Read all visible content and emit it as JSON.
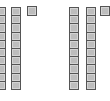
{
  "diagram": {
    "type": "base-ten-blocks",
    "groups": [
      {
        "label": "group-1",
        "tens_rods": 2,
        "units": 1,
        "value": 21,
        "rod_x": [
          -4,
          11
        ],
        "unit_x": 27
      },
      {
        "label": "group-2",
        "tens_rods": 2,
        "units": 1,
        "value": 21,
        "rod_x": [
          69,
          86
        ],
        "unit_x": 100
      }
    ],
    "cells_per_rod": 10,
    "colors": {
      "fill": "#bdbdbd",
      "outline": "#555555",
      "highlight": "#d4d4d4"
    }
  }
}
